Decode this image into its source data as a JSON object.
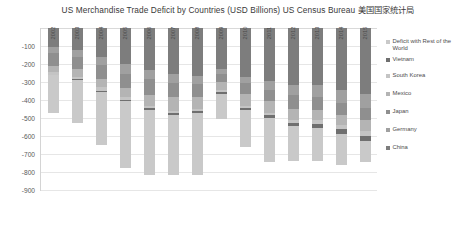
{
  "chart_data": {
    "type": "bar",
    "title": "US Merchandise Trade Deficit by Countries (USD Billions) US Census Bureau 美国国家统计局",
    "xlabel": "",
    "ylabel": "",
    "ylim": [
      -900,
      0
    ],
    "grid": true,
    "legend_position": "right",
    "stacked": true,
    "categories": [
      "2002",
      "2003",
      "2004",
      "2005",
      "2006",
      "2007",
      "2008",
      "2009",
      "2010",
      "2011",
      "2012",
      "2013",
      "2014",
      "2015"
    ],
    "ytick_labels": [
      "-100",
      "-200",
      "-300",
      "-400",
      "-500",
      "-600",
      "-700",
      "-800",
      "-900"
    ],
    "ytick_values": [
      -100,
      -200,
      -300,
      -400,
      -500,
      -600,
      -700,
      -800,
      -900
    ],
    "series": [
      {
        "name": "China",
        "color": "#7d7d7d",
        "values": [
          -103,
          -124,
          -162,
          -202,
          -234,
          -258,
          -268,
          -227,
          -273,
          -295,
          -315,
          -318,
          -343,
          -367
        ]
      },
      {
        "name": "Germany",
        "color": "#a0a0a0",
        "values": [
          -36,
          -39,
          -46,
          -51,
          -48,
          -45,
          -43,
          -28,
          -34,
          -50,
          -60,
          -67,
          -74,
          -75
        ]
      },
      {
        "name": "Japan",
        "color": "#8f8f8f",
        "values": [
          -70,
          -66,
          -75,
          -82,
          -88,
          -83,
          -73,
          -45,
          -60,
          -63,
          -76,
          -73,
          -67,
          -69
        ]
      },
      {
        "name": "Mexico",
        "color": "#b4b4b4",
        "values": [
          -37,
          -41,
          -45,
          -50,
          -64,
          -75,
          -65,
          -47,
          -66,
          -65,
          -62,
          -55,
          -55,
          -60
        ]
      },
      {
        "name": "South Korea",
        "color": "#c4c4c4",
        "values": [
          -13,
          -13,
          -20,
          -16,
          -13,
          -13,
          -13,
          -11,
          -10,
          -13,
          -17,
          -21,
          -25,
          -28
        ]
      },
      {
        "name": "Vietnam",
        "color": "#6f6f6f",
        "values": [
          -2,
          -4,
          -5,
          -6,
          -7,
          -9,
          -11,
          -10,
          -11,
          -13,
          -16,
          -20,
          -25,
          -31
        ]
      },
      {
        "name": "Deficit with Rest of the World",
        "color": "#c9c9c9",
        "values": [
          -209,
          -243,
          -295,
          -369,
          -363,
          -333,
          -343,
          -138,
          -210,
          -248,
          -194,
          -186,
          -172,
          -116
        ]
      }
    ],
    "legend_entries": [
      "Deficit with Rest of the World",
      "Vietnam",
      "South Korea",
      "Mexico",
      "Japan",
      "Germany",
      "China"
    ]
  },
  "colors": {
    "grid": "#e6e6e6",
    "axis": "#d4d4d4",
    "text": "#4c4c4c",
    "title": "#3a3a3a",
    "background": "#ffffff"
  }
}
